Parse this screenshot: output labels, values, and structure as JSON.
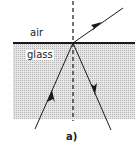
{
  "diagram": {
    "labels": {
      "upper_medium": "air",
      "lower_medium": "glass",
      "caption": "a)"
    },
    "elements": {
      "interface": "air-glass boundary",
      "normal": "dashed normal line",
      "incident_ray": "ray in glass traveling up to interface",
      "refracted_ray": "ray exiting into air",
      "reflected_ray": "ray reflected back into glass"
    },
    "colors": {
      "line": "#1a1a1a",
      "glass_fill": "#d4d4d4"
    }
  }
}
